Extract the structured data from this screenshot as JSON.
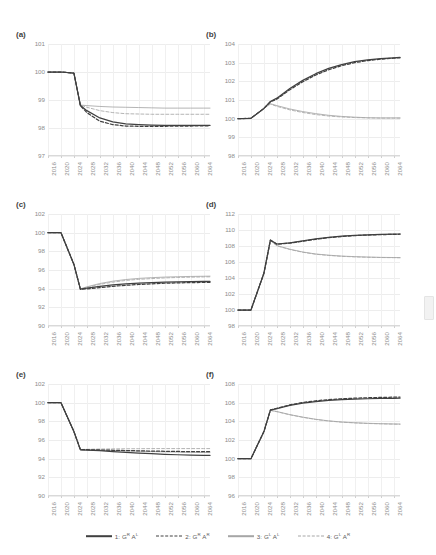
{
  "figure": {
    "panel_labels": [
      "(a)",
      "(b)",
      "(c)",
      "(d)",
      "(e)",
      "(f)"
    ],
    "x_ticks": [
      "2016",
      "2020",
      "2024",
      "2028",
      "2032",
      "2036",
      "2040",
      "2044",
      "2048",
      "2052",
      "2056",
      "2060",
      "2064"
    ]
  },
  "legend": {
    "items": [
      {
        "id": "series1",
        "label_prefix": "1: G",
        "sup1": "R",
        "label_mid": " A",
        "sup2": "L",
        "style": "solid",
        "color": "#404040"
      },
      {
        "id": "series2",
        "label_prefix": "2: G",
        "sup1": "R",
        "label_mid": " A",
        "sup2": "R",
        "style": "dashed",
        "color": "#404040"
      },
      {
        "id": "series3",
        "label_prefix": "3: G",
        "sup1": "L",
        "label_mid": " A",
        "sup2": "L",
        "style": "solid",
        "color": "#a6a6a6"
      },
      {
        "id": "series4",
        "label_prefix": "4: G",
        "sup1": "L",
        "label_mid": " A",
        "sup2": "R",
        "style": "dashed",
        "color": "#a6a6a6"
      }
    ],
    "full_labels": [
      "1: G^R A^L",
      "2: G^R A^R",
      "3: G^L A^L",
      "4: G^L A^R"
    ]
  },
  "colors": {
    "series_dark": "#404040",
    "series_light": "#a6a6a6",
    "grid": "#ededed",
    "tick_text": "#8c8c8c",
    "panel_label": "#3f3f3f",
    "background": "#ffffff"
  },
  "chart_data": [
    {
      "id": "a",
      "type": "line",
      "title": "(a)",
      "xlabel": "",
      "ylabel": "",
      "xlim": [
        2016,
        2066
      ],
      "ylim": [
        97,
        101
      ],
      "yticks": [
        97,
        98,
        99,
        100,
        101
      ],
      "x": [
        2016,
        2020,
        2024,
        2026,
        2028,
        2032,
        2036,
        2040,
        2044,
        2048,
        2052,
        2056,
        2060,
        2064,
        2066
      ],
      "grid": true,
      "legend_position": "bottom-shared",
      "series": [
        {
          "name": "1: G^R A^L",
          "style": "solid",
          "color": "#404040",
          "values": [
            100,
            100,
            99.96,
            98.8,
            98.62,
            98.36,
            98.22,
            98.15,
            98.12,
            98.1,
            98.09,
            98.09,
            98.09,
            98.09,
            98.09
          ]
        },
        {
          "name": "2: G^R A^R",
          "style": "dashed",
          "color": "#404040",
          "values": [
            100,
            100,
            99.96,
            98.8,
            98.55,
            98.24,
            98.12,
            98.07,
            98.06,
            98.06,
            98.06,
            98.07,
            98.07,
            98.08,
            98.08
          ]
        },
        {
          "name": "3: G^L A^L",
          "style": "solid",
          "color": "#a6a6a6",
          "values": [
            100,
            100,
            99.96,
            98.82,
            98.8,
            98.77,
            98.75,
            98.74,
            98.73,
            98.72,
            98.71,
            98.71,
            98.71,
            98.71,
            98.71
          ]
        },
        {
          "name": "4: G^L A^R",
          "style": "dashed",
          "color": "#a6a6a6",
          "values": [
            100,
            100,
            99.96,
            98.82,
            98.74,
            98.62,
            98.55,
            98.51,
            98.5,
            98.49,
            98.49,
            98.49,
            98.49,
            98.49,
            98.49
          ]
        }
      ]
    },
    {
      "id": "b",
      "type": "line",
      "title": "(b)",
      "xlabel": "",
      "ylabel": "",
      "xlim": [
        2016,
        2066
      ],
      "ylim": [
        98,
        104
      ],
      "yticks": [
        98,
        99,
        100,
        101,
        102,
        103,
        104
      ],
      "x": [
        2016,
        2020,
        2024,
        2026,
        2028,
        2032,
        2036,
        2040,
        2044,
        2048,
        2052,
        2056,
        2060,
        2064,
        2066
      ],
      "grid": true,
      "legend_position": "bottom-shared",
      "series": [
        {
          "name": "1: G^R A^L",
          "style": "solid",
          "color": "#404040",
          "values": [
            100,
            100.02,
            100.55,
            100.92,
            101.1,
            101.62,
            102.05,
            102.41,
            102.69,
            102.9,
            103.05,
            103.15,
            103.22,
            103.26,
            103.28
          ]
        },
        {
          "name": "2: G^R A^R",
          "style": "dashed",
          "color": "#404040",
          "values": [
            100,
            100.02,
            100.55,
            100.9,
            101.05,
            101.55,
            101.98,
            102.34,
            102.62,
            102.84,
            103.0,
            103.11,
            103.19,
            103.24,
            103.26
          ]
        },
        {
          "name": "3: G^L A^L",
          "style": "solid",
          "color": "#a6a6a6",
          "values": [
            100,
            100.02,
            100.55,
            100.8,
            100.7,
            100.52,
            100.38,
            100.27,
            100.18,
            100.12,
            100.08,
            100.05,
            100.04,
            100.04,
            100.04
          ]
        },
        {
          "name": "4: G^L A^R",
          "style": "dashed",
          "color": "#a6a6a6",
          "values": [
            100,
            100.02,
            100.55,
            100.78,
            100.66,
            100.47,
            100.33,
            100.22,
            100.14,
            100.09,
            100.06,
            100.04,
            100.03,
            100.03,
            100.03
          ]
        }
      ]
    },
    {
      "id": "c",
      "type": "line",
      "title": "(c)",
      "xlabel": "",
      "ylabel": "",
      "xlim": [
        2016,
        2066
      ],
      "ylim": [
        90,
        102
      ],
      "yticks": [
        90,
        92,
        94,
        96,
        98,
        100,
        102
      ],
      "x": [
        2016,
        2020,
        2024,
        2026,
        2028,
        2032,
        2036,
        2040,
        2044,
        2048,
        2052,
        2056,
        2060,
        2064,
        2066
      ],
      "grid": true,
      "legend_position": "bottom-shared",
      "series": [
        {
          "name": "1: G^R A^L",
          "style": "solid",
          "color": "#404040",
          "values": [
            100,
            100,
            96.6,
            93.95,
            94.05,
            94.25,
            94.4,
            94.52,
            94.6,
            94.66,
            94.7,
            94.73,
            94.75,
            94.77,
            94.78
          ]
        },
        {
          "name": "2: G^R A^R",
          "style": "dashed",
          "color": "#404040",
          "values": [
            100,
            100,
            96.6,
            93.92,
            93.98,
            94.12,
            94.25,
            94.36,
            94.45,
            94.52,
            94.58,
            94.62,
            94.65,
            94.67,
            94.68
          ]
        },
        {
          "name": "3: G^L A^L",
          "style": "solid",
          "color": "#a6a6a6",
          "values": [
            100,
            100,
            96.6,
            93.98,
            94.2,
            94.55,
            94.8,
            94.98,
            95.1,
            95.18,
            95.24,
            95.28,
            95.31,
            95.33,
            95.34
          ]
        },
        {
          "name": "4: G^L A^R",
          "style": "dashed",
          "color": "#a6a6a6",
          "values": [
            100,
            100,
            96.6,
            93.96,
            94.14,
            94.46,
            94.7,
            94.88,
            95.0,
            95.08,
            95.15,
            95.2,
            95.23,
            95.26,
            95.27
          ]
        }
      ]
    },
    {
      "id": "d",
      "type": "line",
      "title": "(d)",
      "xlabel": "",
      "ylabel": "",
      "xlim": [
        2016,
        2066
      ],
      "ylim": [
        98,
        112
      ],
      "yticks": [
        98,
        100,
        102,
        104,
        106,
        108,
        110,
        112
      ],
      "x": [
        2016,
        2020,
        2024,
        2026,
        2028,
        2032,
        2036,
        2040,
        2044,
        2048,
        2052,
        2056,
        2060,
        2064,
        2066
      ],
      "grid": true,
      "legend_position": "bottom-shared",
      "series": [
        {
          "name": "1: G^R A^L",
          "style": "solid",
          "color": "#404040",
          "values": [
            100,
            100,
            104.6,
            108.75,
            108.25,
            108.4,
            108.65,
            108.88,
            109.08,
            109.22,
            109.33,
            109.4,
            109.45,
            109.48,
            109.5
          ]
        },
        {
          "name": "2: G^R A^R",
          "style": "dashed",
          "color": "#404040",
          "values": [
            100,
            100,
            104.6,
            108.72,
            108.22,
            108.36,
            108.6,
            108.84,
            109.04,
            109.19,
            109.3,
            109.37,
            109.42,
            109.46,
            109.47
          ]
        },
        {
          "name": "3: G^L A^L",
          "style": "solid",
          "color": "#a6a6a6",
          "values": [
            100,
            100,
            104.6,
            108.7,
            108.05,
            107.6,
            107.25,
            107.0,
            106.85,
            106.74,
            106.67,
            106.62,
            106.58,
            106.56,
            106.55
          ]
        },
        {
          "name": "4: G^L A^R",
          "style": "dashed",
          "color": "#a6a6a6",
          "values": [
            100,
            100,
            104.6,
            108.68,
            108.02,
            107.56,
            107.22,
            106.97,
            106.82,
            106.71,
            106.64,
            106.59,
            106.56,
            106.54,
            106.53
          ]
        }
      ]
    },
    {
      "id": "e",
      "type": "line",
      "title": "(e)",
      "xlabel": "",
      "ylabel": "",
      "xlim": [
        2016,
        2066
      ],
      "ylim": [
        90,
        102
      ],
      "yticks": [
        90,
        92,
        94,
        96,
        98,
        100,
        102
      ],
      "x": [
        2016,
        2020,
        2024,
        2026,
        2028,
        2032,
        2036,
        2040,
        2044,
        2048,
        2052,
        2056,
        2060,
        2064,
        2066
      ],
      "grid": true,
      "legend_position": "bottom-shared",
      "series": [
        {
          "name": "1: G^R A^L",
          "style": "solid",
          "color": "#404040",
          "values": [
            100,
            100,
            96.9,
            94.95,
            94.92,
            94.85,
            94.76,
            94.68,
            94.6,
            94.53,
            94.47,
            94.42,
            94.38,
            94.35,
            94.34
          ]
        },
        {
          "name": "2: G^R A^R",
          "style": "dashed",
          "color": "#404040",
          "values": [
            100,
            100,
            96.9,
            94.97,
            94.96,
            94.93,
            94.9,
            94.87,
            94.84,
            94.81,
            94.79,
            94.77,
            94.76,
            94.75,
            94.75
          ]
        },
        {
          "name": "3: G^L A^L",
          "style": "solid",
          "color": "#a6a6a6",
          "values": [
            100,
            100,
            96.9,
            94.96,
            94.95,
            94.92,
            94.88,
            94.84,
            94.8,
            94.76,
            94.73,
            94.7,
            94.68,
            94.66,
            94.65
          ]
        },
        {
          "name": "4: G^L A^R",
          "style": "dashed",
          "color": "#a6a6a6",
          "values": [
            100,
            100,
            96.9,
            94.98,
            95.0,
            95.03,
            95.05,
            95.06,
            95.07,
            95.08,
            95.08,
            95.08,
            95.08,
            95.08,
            95.08
          ]
        }
      ]
    },
    {
      "id": "f",
      "type": "line",
      "title": "(f)",
      "xlabel": "",
      "ylabel": "",
      "xlim": [
        2016,
        2066
      ],
      "ylim": [
        96,
        108
      ],
      "yticks": [
        96,
        98,
        100,
        102,
        104,
        106,
        108
      ],
      "x": [
        2016,
        2020,
        2024,
        2026,
        2028,
        2032,
        2036,
        2040,
        2044,
        2048,
        2052,
        2056,
        2060,
        2064,
        2066
      ],
      "grid": true,
      "legend_position": "bottom-shared",
      "series": [
        {
          "name": "1: G^R A^L",
          "style": "solid",
          "color": "#404040",
          "values": [
            100,
            100,
            102.9,
            105.2,
            105.35,
            105.7,
            105.95,
            106.12,
            106.24,
            106.32,
            106.38,
            106.42,
            106.45,
            106.47,
            106.48
          ]
        },
        {
          "name": "2: G^R A^R",
          "style": "dashed",
          "color": "#404040",
          "values": [
            100,
            100,
            102.9,
            105.22,
            105.4,
            105.76,
            106.02,
            106.2,
            106.33,
            106.42,
            106.48,
            106.53,
            106.56,
            106.59,
            106.6
          ]
        },
        {
          "name": "3: G^L A^L",
          "style": "solid",
          "color": "#a6a6a6",
          "values": [
            100,
            100,
            102.9,
            105.18,
            105.05,
            104.72,
            104.45,
            104.22,
            104.05,
            103.93,
            103.85,
            103.79,
            103.75,
            103.72,
            103.71
          ]
        },
        {
          "name": "4: G^L A^R",
          "style": "dashed",
          "color": "#a6a6a6",
          "values": [
            100,
            100,
            102.9,
            105.17,
            105.03,
            104.7,
            104.43,
            104.2,
            104.03,
            103.91,
            103.83,
            103.77,
            103.73,
            103.7,
            103.69
          ]
        }
      ]
    }
  ]
}
